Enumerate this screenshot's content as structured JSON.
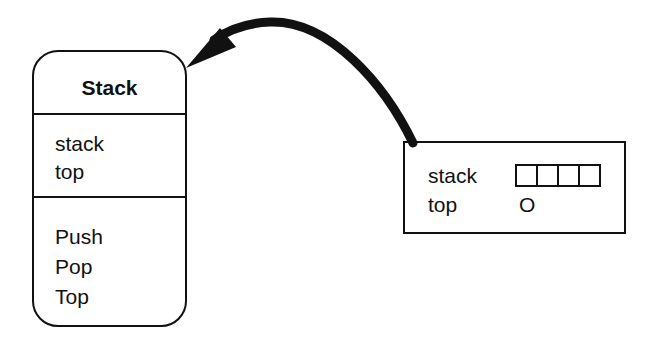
{
  "class_box": {
    "title": "Stack",
    "attributes": [
      "stack",
      "top"
    ],
    "operations": [
      "Push",
      "Pop",
      "Top"
    ]
  },
  "object_box": {
    "fields": [
      {
        "label": "stack",
        "value_type": "array",
        "cells": 4
      },
      {
        "label": "top",
        "value": "O"
      }
    ]
  },
  "arrow": {
    "from": "object_box",
    "to": "class_box",
    "meaning": "instance-of"
  },
  "colors": {
    "stroke": "#111111",
    "background": "#ffffff"
  }
}
